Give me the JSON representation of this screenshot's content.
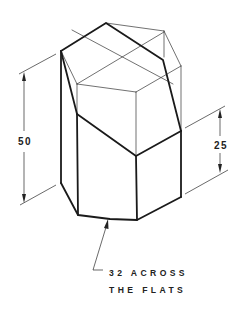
{
  "figure": {
    "type": "isometric technical drawing",
    "ink_color": "#1a1a1a",
    "background": "#ffffff"
  },
  "dimensions": {
    "overall_height": {
      "label": "50"
    },
    "cut_height": {
      "label": "25"
    }
  },
  "note": {
    "line1": "32 ACROSS",
    "line2": "THE FLATS"
  }
}
